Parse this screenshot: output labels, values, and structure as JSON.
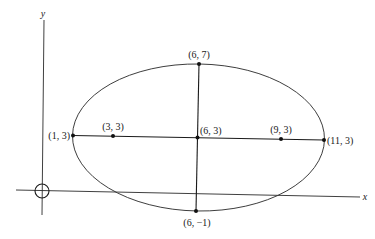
{
  "diagram": {
    "title": "",
    "axes": {
      "x_label": "x",
      "y_label": "y"
    },
    "ellipse": {
      "center_label": "(6, 3)",
      "equation_center": [
        6,
        3
      ],
      "semi_major_horizontal": 5,
      "semi_minor_vertical": 4
    },
    "points": [
      {
        "id": "vertex-left",
        "label": "(1, 3)",
        "coords": [
          1,
          3
        ]
      },
      {
        "id": "focus-left",
        "label": "(3, 3)",
        "coords": [
          3,
          3
        ]
      },
      {
        "id": "center",
        "label": "(6, 3)",
        "coords": [
          6,
          3
        ]
      },
      {
        "id": "focus-right",
        "label": "(9, 3)",
        "coords": [
          9,
          3
        ]
      },
      {
        "id": "vertex-right",
        "label": "(11, 3)",
        "coords": [
          11,
          3
        ]
      },
      {
        "id": "co-vertex-top",
        "label": "(6, 7)",
        "coords": [
          6,
          7
        ]
      },
      {
        "id": "co-vertex-bottom",
        "label": "(6, −1)",
        "coords": [
          6,
          -1
        ]
      }
    ],
    "origin_marker": "circle-with-cross"
  }
}
